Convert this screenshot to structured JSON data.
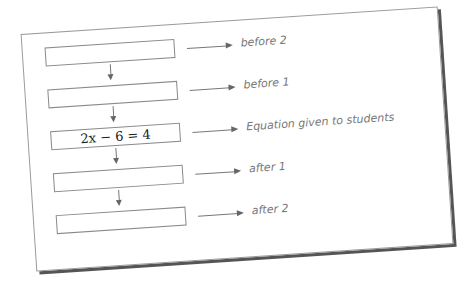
{
  "diagram": {
    "boxes": [
      {
        "id": "before-2",
        "text": "",
        "label": "before 2"
      },
      {
        "id": "before-1",
        "text": "",
        "label": "before 1"
      },
      {
        "id": "equation",
        "text": "2x − 6 = 4",
        "label": "Equation given to students"
      },
      {
        "id": "after-1",
        "text": "",
        "label": "after 1"
      },
      {
        "id": "after-2",
        "text": "",
        "label": "after 2"
      }
    ]
  },
  "colors": {
    "line": "#777777",
    "text": "#777777",
    "shadow": "#555555"
  }
}
